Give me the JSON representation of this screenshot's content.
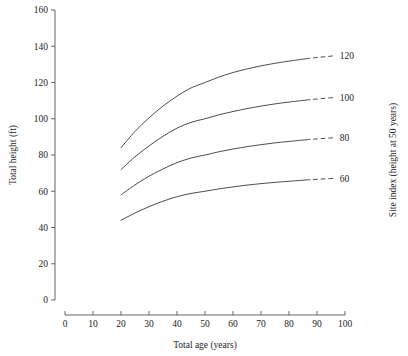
{
  "chart_data": {
    "type": "line",
    "title": "",
    "xlabel": "Total age (years)",
    "ylabel": "Total height (ft)",
    "y2label": "Site index (height at 50 years)",
    "xlim": [
      0,
      100
    ],
    "ylim": [
      0,
      160
    ],
    "xticks": [
      0,
      10,
      20,
      30,
      40,
      50,
      60,
      70,
      80,
      90,
      100
    ],
    "yticks": [
      0,
      20,
      40,
      60,
      80,
      100,
      120,
      140,
      160
    ],
    "xticklabels": [
      "0",
      "10",
      "20",
      "30",
      "40",
      "50",
      "60",
      "70",
      "80",
      "90",
      "100"
    ],
    "yticklabels": [
      "0",
      "20",
      "40",
      "60",
      "80",
      "100",
      "120",
      "140",
      "160"
    ],
    "grid": false,
    "legend_position": "right-axis-labels",
    "solid_range": [
      20,
      86
    ],
    "dashed_range": [
      86,
      96
    ],
    "series": [
      {
        "name": "120",
        "label": "120",
        "x": [
          20,
          25,
          30,
          35,
          40,
          45,
          50,
          55,
          60,
          65,
          70,
          75,
          80,
          86,
          90,
          96
        ],
        "values": [
          84,
          93,
          100.5,
          107,
          112.5,
          117,
          120,
          123,
          125.5,
          127.5,
          129.2,
          130.6,
          131.8,
          133.1,
          133.8,
          134.7
        ]
      },
      {
        "name": "100",
        "label": "100",
        "x": [
          20,
          25,
          30,
          35,
          40,
          45,
          50,
          55,
          60,
          65,
          70,
          75,
          80,
          86,
          90,
          96
        ],
        "values": [
          72,
          79,
          85,
          90.3,
          94.8,
          98,
          100,
          102.2,
          104,
          105.6,
          107,
          108.2,
          109.2,
          110.3,
          110.9,
          111.7
        ]
      },
      {
        "name": "80",
        "label": "80",
        "x": [
          20,
          25,
          30,
          35,
          40,
          45,
          50,
          55,
          60,
          65,
          70,
          75,
          80,
          86,
          90,
          96
        ],
        "values": [
          58,
          63.5,
          68.3,
          72.3,
          75.8,
          78.3,
          80,
          81.8,
          83.3,
          84.6,
          85.7,
          86.7,
          87.5,
          88.4,
          88.9,
          89.5
        ]
      },
      {
        "name": "60",
        "label": "60",
        "x": [
          20,
          25,
          30,
          35,
          40,
          45,
          50,
          55,
          60,
          65,
          70,
          75,
          80,
          86,
          90,
          96
        ],
        "values": [
          44,
          48,
          51.5,
          54.5,
          57,
          58.8,
          60,
          61.3,
          62.4,
          63.4,
          64.2,
          64.9,
          65.5,
          66.2,
          66.6,
          67.1
        ]
      }
    ]
  }
}
